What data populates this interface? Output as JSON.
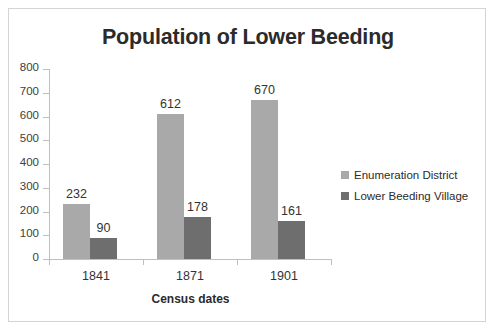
{
  "chart_data": {
    "type": "bar",
    "title": "Population of Lower Beeding",
    "xlabel": "Census dates",
    "ylabel": "",
    "categories": [
      "1841",
      "1871",
      "1901"
    ],
    "series": [
      {
        "name": "Enumeration District",
        "values": [
          232,
          612,
          670
        ],
        "color": "#a9a9a9"
      },
      {
        "name": "Lower Beeding Village",
        "values": [
          90,
          178,
          161
        ],
        "color": "#6e6e6e"
      }
    ],
    "ylim": [
      0,
      800
    ],
    "ytick_labels": [
      "800",
      "700",
      "600",
      "500",
      "400",
      "300",
      "200",
      "100",
      "0"
    ],
    "ytick_values": [
      800,
      700,
      600,
      500,
      400,
      300,
      200,
      100,
      0
    ],
    "grid": false,
    "legend_position": "right",
    "data_labels": [
      {
        "category": "1841",
        "series": "Enumeration District",
        "text": "232"
      },
      {
        "category": "1841",
        "series": "Lower Beeding Village",
        "text": "90"
      },
      {
        "category": "1871",
        "series": "Enumeration District",
        "text": "612"
      },
      {
        "category": "1871",
        "series": "Lower Beeding Village",
        "text": "178"
      },
      {
        "category": "1901",
        "series": "Enumeration District",
        "text": "670"
      },
      {
        "category": "1901",
        "series": "Lower Beeding Village",
        "text": "161"
      }
    ]
  }
}
